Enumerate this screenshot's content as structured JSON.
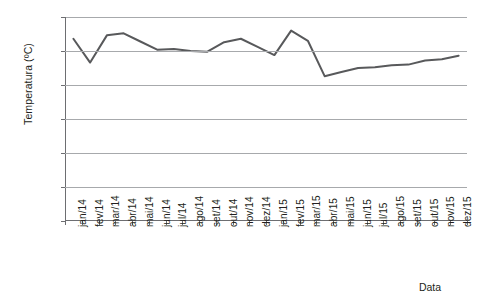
{
  "chart_data": {
    "type": "line",
    "title": "",
    "xlabel": "Data",
    "ylabel": "Temperatura (ºC)",
    "ylim": [
      0,
      30
    ],
    "yticks": [
      0,
      5,
      10,
      15,
      20,
      25,
      30
    ],
    "grid": "horizontal",
    "legend": "none",
    "line_color": "#58595b",
    "categories": [
      "jan/14",
      "fev/14",
      "mar/14",
      "abr/14",
      "mai/14",
      "jun/14",
      "jul/14",
      "ago/14",
      "set/14",
      "out/14",
      "nov/14",
      "dez/14",
      "jan/15",
      "fev/15",
      "mar/15",
      "abr/15",
      "mai/15",
      "jun/15",
      "jul/15",
      "ago/15",
      "set/15",
      "out/15",
      "nov/15",
      "dez/15"
    ],
    "values": [
      26.8,
      23.3,
      27.3,
      27.6,
      26.4,
      25.2,
      25.3,
      25.0,
      24.9,
      26.3,
      26.8,
      25.6,
      24.4,
      28.0,
      26.5,
      21.3,
      21.9,
      22.5,
      22.6,
      22.9,
      23.0,
      23.6,
      23.8,
      24.3
    ],
    "series": [
      {
        "name": "Temperatura",
        "values": [
          26.8,
          23.3,
          27.3,
          27.6,
          26.4,
          25.2,
          25.3,
          25.0,
          24.9,
          26.3,
          26.8,
          25.6,
          24.4,
          28.0,
          26.5,
          21.3,
          21.9,
          22.5,
          22.6,
          22.9,
          23.0,
          23.6,
          23.8,
          24.3
        ]
      }
    ]
  }
}
